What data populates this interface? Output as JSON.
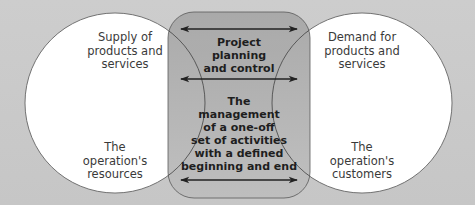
{
  "diagram": {
    "left_circle": {
      "top_text": [
        "Supply of",
        "products and",
        "services"
      ],
      "bottom_text": [
        "The",
        "operation's",
        "resources"
      ]
    },
    "right_circle": {
      "top_text": [
        "Demand for",
        "products and",
        "services"
      ],
      "bottom_text": [
        "The",
        "operation's",
        "customers"
      ]
    },
    "center_box": {
      "upper_text": [
        "Project",
        "planning",
        "and control"
      ],
      "lower_text": [
        "The",
        "management",
        "of a one-off",
        "set of activities",
        "with a defined",
        "beginning and end"
      ]
    },
    "arrows": [
      {
        "type": "double-headed",
        "y": 29
      },
      {
        "type": "double-headed",
        "y": 79
      },
      {
        "type": "double-headed",
        "y": 180
      }
    ],
    "colors": {
      "background": "#c9c9c9",
      "circle_fill": "#ffffff",
      "box_fill_top": "#a9a9a9",
      "box_fill_bottom": "#bdbdbd",
      "stroke": "#555555",
      "arrow": "#222222"
    }
  }
}
